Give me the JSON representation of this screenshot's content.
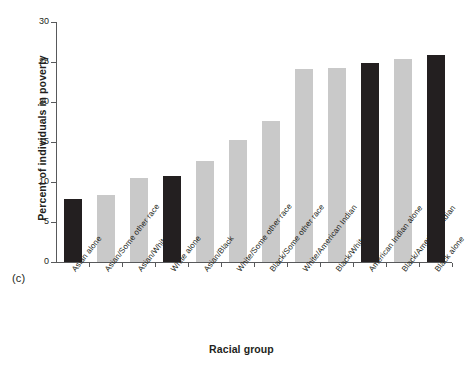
{
  "figure": {
    "subfigure_label": "(c)"
  },
  "chart_data": {
    "type": "bar",
    "title": "",
    "xlabel": "Racial group",
    "ylabel": "Percent of individuals in poverty",
    "ylim": [
      0,
      30
    ],
    "ytick_labels": [
      "0",
      "5",
      "10",
      "15",
      "20",
      "25",
      "30"
    ],
    "ytick_values": [
      0,
      5,
      10,
      15,
      20,
      25,
      30
    ],
    "grid": false,
    "legend": "none",
    "categories": [
      "Asian alone",
      "Asian/Some other race",
      "Asian/White",
      "White alone",
      "Asian/Black",
      "White/Some other race",
      "Black/Some other race",
      "White/American Indian",
      "Black/White",
      "American Indian alone",
      "Black/American Indian",
      "Black alone"
    ],
    "values": [
      7.9,
      8.4,
      10.5,
      10.7,
      12.6,
      15.2,
      17.6,
      24.1,
      24.2,
      24.9,
      25.4,
      25.9
    ],
    "bar_colors": [
      "#231f20",
      "#c9c9c9",
      "#c9c9c9",
      "#231f20",
      "#c9c9c9",
      "#c9c9c9",
      "#c9c9c9",
      "#c9c9c9",
      "#c9c9c9",
      "#231f20",
      "#c9c9c9",
      "#231f20"
    ],
    "colors": {
      "single_race": "#231f20",
      "multi_race": "#c9c9c9",
      "axis": "#58595b"
    }
  }
}
